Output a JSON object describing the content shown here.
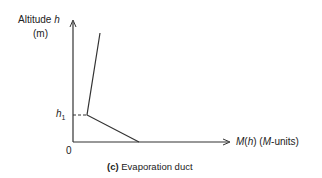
{
  "diagram": {
    "y_label_line1": "Altitude ",
    "y_label_var": "h",
    "y_label_line2": "(m)",
    "h1_label": "h",
    "h1_sub": "1",
    "origin": "0",
    "x_label_fn": "M",
    "x_label_paren1": "(",
    "x_label_var": "h",
    "x_label_paren2": ") (",
    "x_label_unit_var": "M",
    "x_label_unit_rest": "-units)",
    "caption_tag": "(c)",
    "caption_text": " Evaporation duct",
    "line_color": "#333333"
  }
}
